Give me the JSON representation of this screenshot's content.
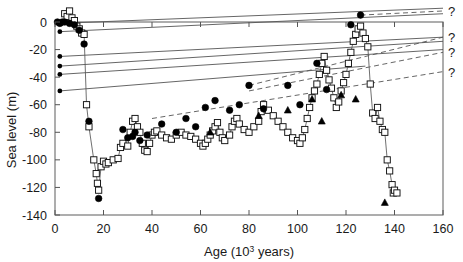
{
  "figure": {
    "title": "",
    "background": "#ffffff",
    "line_color": "#555555",
    "marker_stroke": "#111111",
    "marker_fill_open": "#ffffff",
    "marker_fill_closed": "#000000"
  },
  "axes": {
    "x": {
      "label_main": "Age (10",
      "label_sup": "3",
      "label_tail": " years)",
      "label_full": "Age (10³ years)",
      "min": 0,
      "max": 160,
      "tick_step": 20,
      "ticks": [
        0,
        20,
        40,
        60,
        80,
        100,
        120,
        140,
        160
      ],
      "tick_labels": [
        "0",
        "20",
        "40",
        "60",
        "80",
        "100",
        "120",
        "140",
        "160"
      ]
    },
    "y": {
      "label_full": "Sea level (m)",
      "min": -140,
      "max": 0,
      "tick_step": 20,
      "ticks": [
        0,
        -20,
        -40,
        -60,
        -80,
        -100,
        -120,
        -140
      ],
      "tick_labels": [
        "0",
        "-20",
        "-40",
        "-60",
        "-80",
        "-100",
        "-120",
        "-140"
      ]
    },
    "grid": false,
    "frame": "full-box"
  },
  "annotations": {
    "question_marks": [
      {
        "text": "?",
        "x": 160,
        "y": 8
      },
      {
        "text": "?",
        "x": 160,
        "y": -11
      },
      {
        "text": "?",
        "x": 160,
        "y": -22
      },
      {
        "text": "?",
        "x": 160,
        "y": -36
      }
    ]
  },
  "chart_data": {
    "type": "scatter",
    "title": "",
    "xlabel": "Age (10³ years)",
    "ylabel": "Sea level (m)",
    "xlim": [
      0,
      160
    ],
    "ylim": [
      -140,
      0
    ],
    "grid": false,
    "legend": "none",
    "series": [
      {
        "name": "open-square-record",
        "marker": "open-square",
        "connected": true,
        "points": [
          [
            4,
            6
          ],
          [
            5,
            4
          ],
          [
            6,
            8
          ],
          [
            7,
            3
          ],
          [
            8,
            1
          ],
          [
            9,
            -3
          ],
          [
            10,
            -5
          ],
          [
            11,
            -8
          ],
          [
            12,
            -9
          ],
          [
            13,
            -60
          ],
          [
            14,
            -76
          ],
          [
            16,
            -100
          ],
          [
            17,
            -110
          ],
          [
            17.5,
            -117
          ],
          [
            18,
            -122
          ],
          [
            19,
            -105
          ],
          [
            20,
            -101
          ],
          [
            21,
            -103
          ],
          [
            22,
            -102
          ],
          [
            24,
            -100
          ],
          [
            26,
            -99
          ],
          [
            27,
            -91
          ],
          [
            28,
            -88
          ],
          [
            30,
            -90
          ],
          [
            31,
            -80
          ],
          [
            32,
            -72
          ],
          [
            33,
            -70
          ],
          [
            34,
            -76
          ],
          [
            35,
            -80
          ],
          [
            36,
            -88
          ],
          [
            37,
            -93
          ],
          [
            38,
            -94
          ],
          [
            39,
            -88
          ],
          [
            40,
            -82
          ],
          [
            41,
            -80
          ],
          [
            42,
            -79
          ],
          [
            44,
            -82
          ],
          [
            46,
            -84
          ],
          [
            48,
            -85
          ],
          [
            50,
            -82
          ],
          [
            52,
            -80
          ],
          [
            54,
            -82
          ],
          [
            56,
            -83
          ],
          [
            58,
            -85
          ],
          [
            60,
            -88
          ],
          [
            61,
            -90
          ],
          [
            62,
            -88
          ],
          [
            63,
            -85
          ],
          [
            64,
            -82
          ],
          [
            65,
            -79
          ],
          [
            66,
            -76
          ],
          [
            67,
            -73
          ],
          [
            68,
            -80
          ],
          [
            69,
            -84
          ],
          [
            70,
            -86
          ],
          [
            72,
            -82
          ],
          [
            73,
            -76
          ],
          [
            74,
            -72
          ],
          [
            75,
            -70
          ],
          [
            76,
            -74
          ],
          [
            78,
            -78
          ],
          [
            80,
            -80
          ],
          [
            82,
            -76
          ],
          [
            84,
            -72
          ],
          [
            85,
            -65
          ],
          [
            86,
            -60
          ],
          [
            88,
            -64
          ],
          [
            90,
            -68
          ],
          [
            92,
            -72
          ],
          [
            94,
            -76
          ],
          [
            96,
            -80
          ],
          [
            98,
            -84
          ],
          [
            100,
            -86
          ],
          [
            101,
            -88
          ],
          [
            102,
            -84
          ],
          [
            103,
            -78
          ],
          [
            104,
            -70
          ],
          [
            105,
            -62
          ],
          [
            106,
            -55
          ],
          [
            107,
            -50
          ],
          [
            108,
            -45
          ],
          [
            109,
            -38
          ],
          [
            110,
            -30
          ],
          [
            111,
            -25
          ],
          [
            112,
            -35
          ],
          [
            113,
            -42
          ],
          [
            114,
            -48
          ],
          [
            115,
            -55
          ],
          [
            116,
            -62
          ],
          [
            117,
            -58
          ],
          [
            118,
            -50
          ],
          [
            119,
            -44
          ],
          [
            120,
            -38
          ],
          [
            121,
            -30
          ],
          [
            122,
            -22
          ],
          [
            123,
            -14
          ],
          [
            124,
            -9
          ],
          [
            125,
            -5
          ],
          [
            126,
            -3
          ],
          [
            127,
            -8
          ],
          [
            128,
            -12
          ],
          [
            129,
            -18
          ],
          [
            130,
            -45
          ],
          [
            131,
            -66
          ],
          [
            132,
            -70
          ],
          [
            133,
            -62
          ],
          [
            134,
            -72
          ],
          [
            135,
            -78
          ],
          [
            136,
            -80
          ],
          [
            137,
            -100
          ],
          [
            138,
            -108
          ],
          [
            139,
            -118
          ],
          [
            139.5,
            -124
          ],
          [
            140,
            -122
          ],
          [
            141,
            -124
          ]
        ]
      },
      {
        "name": "filled-circle-record",
        "marker": "filled-circle",
        "connected": false,
        "points": [
          [
            1,
            0
          ],
          [
            2,
            -1
          ],
          [
            3,
            0
          ],
          [
            4,
            0
          ],
          [
            6,
            -1
          ],
          [
            8,
            -2
          ],
          [
            10,
            -6
          ],
          [
            12,
            -16
          ],
          [
            14,
            -72
          ],
          [
            18,
            -128
          ],
          [
            28,
            -78
          ],
          [
            30,
            -84
          ],
          [
            32,
            -83
          ],
          [
            33,
            -80
          ],
          [
            35,
            -86
          ],
          [
            38,
            -82
          ],
          [
            44,
            -74
          ],
          [
            50,
            -80
          ],
          [
            54,
            -70
          ],
          [
            58,
            -76
          ],
          [
            62,
            -62
          ],
          [
            66,
            -57
          ],
          [
            72,
            -64
          ],
          [
            76,
            -60
          ],
          [
            80,
            -46
          ],
          [
            86,
            -63
          ],
          [
            96,
            -46
          ],
          [
            101,
            -60
          ],
          [
            108,
            -30
          ],
          [
            112,
            -49
          ],
          [
            122,
            -2
          ],
          [
            126,
            5
          ]
        ]
      },
      {
        "name": "filled-triangle-record",
        "marker": "filled-triangle",
        "connected": false,
        "points": [
          [
            64,
            -80
          ],
          [
            84,
            -68
          ],
          [
            96,
            -64
          ],
          [
            106,
            -56
          ],
          [
            110,
            -72
          ],
          [
            118,
            -53
          ],
          [
            124,
            -56
          ],
          [
            136,
            -131
          ]
        ]
      },
      {
        "name": "solid-uplift-line-1",
        "marker": "none",
        "style": "solid",
        "points": [
          [
            2,
            -1
          ],
          [
            160,
            10
          ]
        ]
      },
      {
        "name": "solid-uplift-line-2",
        "marker": "none",
        "style": "solid",
        "points": [
          [
            2,
            -7
          ],
          [
            160,
            6
          ]
        ]
      },
      {
        "name": "solid-uplift-line-3",
        "marker": "none",
        "style": "solid",
        "points": [
          [
            2,
            -25
          ],
          [
            160,
            -11
          ]
        ]
      },
      {
        "name": "solid-uplift-line-4",
        "marker": "none",
        "style": "solid",
        "points": [
          [
            2,
            -32
          ],
          [
            160,
            -14
          ]
        ]
      },
      {
        "name": "solid-uplift-line-5",
        "marker": "none",
        "style": "solid",
        "points": [
          [
            2,
            -38
          ],
          [
            160,
            -20
          ]
        ]
      },
      {
        "name": "solid-uplift-line-6",
        "marker": "none",
        "style": "solid",
        "points": [
          [
            2,
            -50
          ],
          [
            128,
            -32
          ]
        ]
      },
      {
        "name": "dashed-extrapolation-1",
        "marker": "none",
        "style": "dashed",
        "points": [
          [
            126,
            5
          ],
          [
            160,
            8
          ]
        ]
      },
      {
        "name": "dashed-extrapolation-2",
        "marker": "none",
        "style": "dashed",
        "points": [
          [
            80,
            -46
          ],
          [
            160,
            -11
          ]
        ]
      },
      {
        "name": "dashed-extrapolation-3",
        "marker": "none",
        "style": "dashed",
        "points": [
          [
            80,
            -50
          ],
          [
            160,
            -22
          ]
        ]
      },
      {
        "name": "dashed-extrapolation-4",
        "marker": "none",
        "style": "dashed",
        "points": [
          [
            40,
            -70
          ],
          [
            160,
            -36
          ]
        ]
      }
    ]
  }
}
